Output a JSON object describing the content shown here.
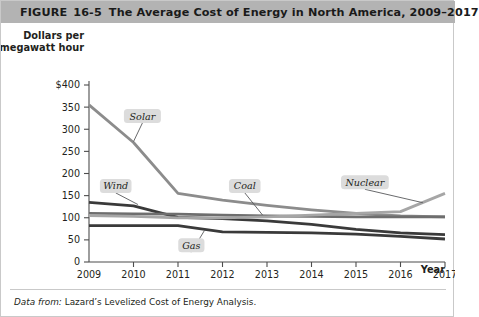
{
  "header": {
    "figure_word": "FIGURE",
    "figure_number": "16-5",
    "title": "The Average Cost of Energy in North America, 2009–2017",
    "bar_color": "#b3b3b3"
  },
  "footnote": {
    "label": "Data from:",
    "text": "Lazard’s Levelized Cost of Energy Analysis."
  },
  "chart_data": {
    "type": "line",
    "title": "The Average Cost of Energy in North America, 2009–2017",
    "ylabel_line1": "Dollars per",
    "ylabel_line2": "megawatt hour",
    "xlabel": "Year",
    "x": [
      2009,
      2010,
      2011,
      2012,
      2013,
      2014,
      2015,
      2016,
      2017
    ],
    "xticklabels": [
      "2009",
      "2010",
      "2011",
      "2012",
      "2013",
      "2014",
      "2015",
      "2016",
      "2017"
    ],
    "yticks": [
      0,
      50,
      100,
      150,
      200,
      250,
      300,
      350,
      400
    ],
    "yticklabels": [
      "0",
      "50",
      "100",
      "150",
      "200",
      "250",
      "300",
      "350",
      "$400"
    ],
    "ylim": [
      0,
      400
    ],
    "xlim": [
      2009,
      2017
    ],
    "grid": false,
    "legend": "inline-labels",
    "series": [
      {
        "name": "Solar",
        "color": "#8c8c8c",
        "width": 2.8,
        "values": [
          355,
          270,
          155,
          140,
          128,
          118,
          110,
          104,
          102
        ],
        "label_x": 2010.2,
        "label_y": 330,
        "leader_to_x": 2010.0,
        "leader_to_y": 272
      },
      {
        "name": "Wind",
        "color": "#3a3a3a",
        "width": 2.8,
        "values": [
          135,
          127,
          101,
          98,
          93,
          85,
          74,
          66,
          62
        ],
        "label_x": 2009.6,
        "label_y": 172,
        "leader_to_x": 2010.1,
        "leader_to_y": 130
      },
      {
        "name": "Coal",
        "color": "#6e6e6e",
        "width": 2.8,
        "values": [
          110,
          109,
          108,
          106,
          104,
          103,
          102,
          102,
          102
        ],
        "label_x": 2012.5,
        "label_y": 172,
        "leader_to_x": 2012.9,
        "leader_to_y": 106
      },
      {
        "name": "Gas",
        "color": "#3a3a3a",
        "width": 2.8,
        "values": [
          82,
          82,
          82,
          68,
          67,
          66,
          63,
          58,
          52
        ],
        "label_x": 2011.3,
        "label_y": 38,
        "leader_to_x": 2011.6,
        "leader_to_y": 72
      },
      {
        "name": "Nuclear",
        "color": "#a6a6a6",
        "width": 2.8,
        "values": [
          105,
          103,
          100,
          100,
          102,
          106,
          110,
          114,
          155
        ],
        "label_x": 2015.2,
        "label_y": 180,
        "leader_to_x": 2016.5,
        "leader_to_y": 134
      }
    ]
  }
}
